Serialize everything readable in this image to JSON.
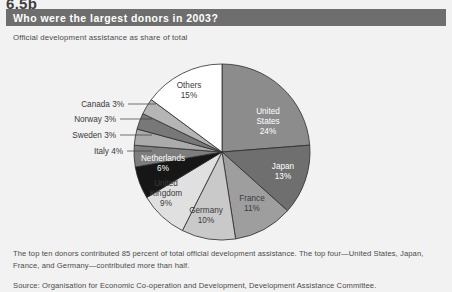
{
  "section_number": "6.5b",
  "header": {
    "title": "Who were the largest donors in 2003?"
  },
  "subtitle": "Official development assistance as share of total",
  "caption": "The top ten donors contributed 85 percent of total official development assistance. The top four—United States, Japan, France, and Germany—contributed more than half.",
  "source": "Source: Organisation for Economic Co-operation and Development, Development Assistance Committee.",
  "colors": {
    "page_background": "#f2f2f2",
    "header_bar": "#6e6e6e",
    "header_text": "#ffffff",
    "body_text": "#4a4a4a",
    "slice_outline": "#2b2b2b"
  },
  "chart_data": {
    "type": "pie",
    "title": "Who were the largest donors in 2003?",
    "subtitle": "Official development assistance as share of total",
    "unit": "percent",
    "start_angle_deg": 0,
    "direction": "clockwise",
    "center": {
      "x": 222,
      "y": 106
    },
    "radius": 88,
    "legend": "none",
    "grid": false,
    "labels": [
      "United States",
      "Japan",
      "France",
      "Germany",
      "United Kingdom",
      "Netherlands",
      "Italy",
      "Sweden",
      "Norway",
      "Canada",
      "Others"
    ],
    "values": [
      24,
      13,
      11,
      10,
      9,
      6,
      4,
      3,
      3,
      3,
      15
    ],
    "slices": [
      {
        "name": "United States",
        "value": 24,
        "label": "United States",
        "pct_label": "24%",
        "color": "#8c8c8c",
        "text_color": "#ffffff",
        "label_position": "inside",
        "label_x": 268,
        "label_y": 78
      },
      {
        "name": "Japan",
        "value": 13,
        "label": "Japan",
        "pct_label": "13%",
        "color": "#6f6f6f",
        "text_color": "#ffffff",
        "label_position": "inside",
        "label_x": 283,
        "label_y": 128
      },
      {
        "name": "France",
        "value": 11,
        "label": "France",
        "pct_label": "11%",
        "color": "#9e9e9e",
        "text_color": "#3a3a3a",
        "label_position": "inside",
        "label_x": 252,
        "label_y": 160
      },
      {
        "name": "Germany",
        "value": 10,
        "label": "Germany",
        "pct_label": "10%",
        "color": "#c9c9c9",
        "text_color": "#3a3a3a",
        "label_position": "inside",
        "label_x": 206,
        "label_y": 172
      },
      {
        "name": "United Kingdom",
        "value": 9,
        "label": "United Kingdom",
        "pct_label": "9%",
        "color": "#e0e0e0",
        "text_color": "#3a3a3a",
        "label_position": "inside",
        "label_x": 166,
        "label_y": 150
      },
      {
        "name": "Netherlands",
        "value": 6,
        "label": "Netherlands",
        "pct_label": "6%",
        "color": "#161616",
        "text_color": "#ffffff",
        "label_position": "inside",
        "label_x": 163,
        "label_y": 120
      },
      {
        "name": "Italy",
        "value": 4,
        "label": "Italy 4%",
        "pct_label": "4%",
        "color": "#7d7d7d",
        "text_color": "#3a3a3a",
        "label_position": "outside",
        "label_x": 123,
        "label_y": 108,
        "leader_x2": 152,
        "leader_y2": 108
      },
      {
        "name": "Sweden",
        "value": 3,
        "label": "Sweden 3%",
        "pct_label": "3%",
        "color": "#ababab",
        "text_color": "#3a3a3a",
        "label_position": "outside",
        "label_x": 116,
        "label_y": 92,
        "leader_x2": 152,
        "leader_y2": 92
      },
      {
        "name": "Norway",
        "value": 3,
        "label": "Norway 3%",
        "pct_label": "3%",
        "color": "#787878",
        "text_color": "#3a3a3a",
        "label_position": "outside",
        "label_x": 116,
        "label_y": 76,
        "leader_x2": 152,
        "leader_y2": 76
      },
      {
        "name": "Canada",
        "value": 3,
        "label": "Canada 3%",
        "pct_label": "3%",
        "color": "#b5b5b5",
        "text_color": "#3a3a3a",
        "label_position": "outside",
        "label_x": 124,
        "label_y": 61,
        "leader_x2": 156,
        "leader_y2": 61
      },
      {
        "name": "Others",
        "value": 15,
        "label": "Others",
        "pct_label": "15%",
        "color": "#ffffff",
        "text_color": "#3a3a3a",
        "label_position": "inside",
        "label_x": 189,
        "label_y": 47
      }
    ]
  }
}
